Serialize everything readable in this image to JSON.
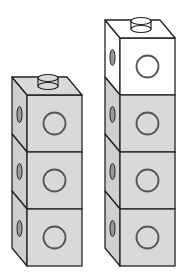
{
  "diagram": {
    "colors": {
      "shaded_face": "#d9d9d9",
      "side_face": "#cfcfcf",
      "unshaded_face": "#ffffff",
      "outline": "#222222",
      "hole": "#555555"
    },
    "stacks": [
      {
        "name": "left-stack",
        "cube_count": 3,
        "cubes": [
          {
            "shaded": true
          },
          {
            "shaded": true
          },
          {
            "shaded": true
          }
        ]
      },
      {
        "name": "right-stack",
        "cube_count": 4,
        "cubes": [
          {
            "shaded": false
          },
          {
            "shaded": true
          },
          {
            "shaded": true
          },
          {
            "shaded": true
          }
        ]
      }
    ]
  }
}
